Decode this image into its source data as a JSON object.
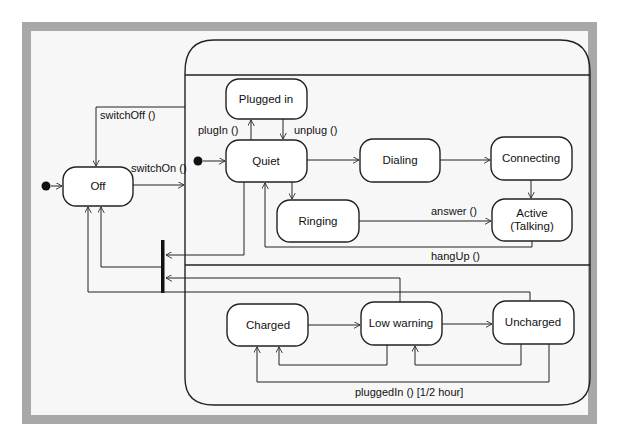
{
  "diagram": {
    "type": "UML state machine",
    "colors": {
      "frame": "#a8a8a8",
      "background": "#f7f7f7",
      "line": "#222222"
    },
    "states": {
      "off": "Off",
      "plugged_in": "Plugged in",
      "quiet": "Quiet",
      "dialing": "Dialing",
      "connecting": "Connecting",
      "ringing": "Ringing",
      "active_line1": "Active",
      "active_line2": "(Talking)",
      "charged": "Charged",
      "low_warning": "Low warning",
      "uncharged": "Uncharged"
    },
    "transitions": {
      "switch_off": "switchOff ()",
      "switch_on": "switchOn ()",
      "plug_in": "plugIn ()",
      "unplug": "unplug ()",
      "answer": "answer ()",
      "hang_up": "hangUp ()",
      "plugged_in_guard": "pluggedIn () [1/2 hour]"
    }
  }
}
